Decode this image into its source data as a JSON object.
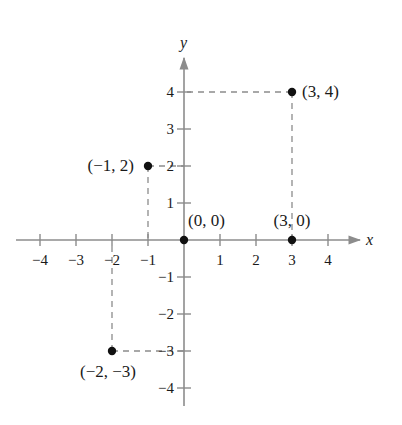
{
  "chart_data": {
    "type": "scatter",
    "title": "",
    "xlabel": "x",
    "ylabel": "y",
    "xlim": [
      -4,
      4
    ],
    "ylim": [
      -4,
      4
    ],
    "grid": false,
    "x_ticks": [
      -4,
      -3,
      -2,
      -1,
      1,
      2,
      3,
      4
    ],
    "x_tick_labels": [
      "−4",
      "−3",
      "−2",
      "−1",
      "1",
      "2",
      "3",
      "4"
    ],
    "y_ticks": [
      4,
      3,
      2,
      1,
      -1,
      -2,
      -3,
      -4
    ],
    "y_tick_labels": [
      "4",
      "3",
      "2",
      "1",
      "−1",
      "−2",
      "−3",
      "−4"
    ],
    "points": [
      {
        "x": 3,
        "y": 4,
        "label": "(3, 4)",
        "dashed_guides": true
      },
      {
        "x": -1,
        "y": 2,
        "label": "(−1, 2)",
        "dashed_guides": true
      },
      {
        "x": 0,
        "y": 0,
        "label": "(0, 0)",
        "dashed_guides": false
      },
      {
        "x": 3,
        "y": 0,
        "label": "(3, 0)",
        "dashed_guides": false
      },
      {
        "x": -2,
        "y": -3,
        "label": "(−2, −3)",
        "dashed_guides": true
      }
    ],
    "colors": {
      "axis": "#8c8c8c",
      "guide": "#8c8c8c",
      "point": "#111111",
      "text": "#1a1a1a"
    }
  }
}
